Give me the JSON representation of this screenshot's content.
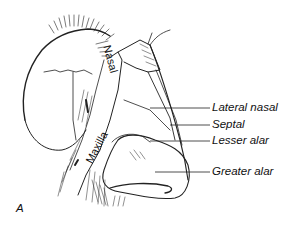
{
  "figure": {
    "panel_label": "A",
    "structure_labels": {
      "nasal": "Nasal",
      "maxilla": "Maxilla"
    },
    "callouts": [
      {
        "label": "Lateral nasal"
      },
      {
        "label": "Septal"
      },
      {
        "label": "Lesser alar"
      },
      {
        "label": "Greater alar"
      }
    ],
    "colors": {
      "ink": "#111111",
      "background": "#ffffff"
    }
  }
}
